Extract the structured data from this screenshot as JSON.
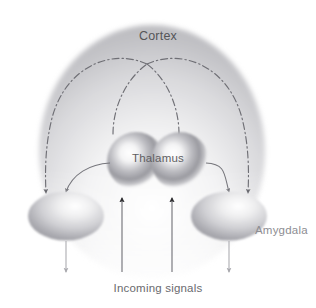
{
  "figure": {
    "title_region": "brain-fear-pathway-diagram",
    "background_color": "#ffffff"
  },
  "labels": {
    "cortex": "Cortex",
    "thalamus": "Thalamus",
    "amygdala": "Amygdala",
    "incoming_signals": "Incoming signals"
  },
  "colors": {
    "cortex_fill_dark": "#b9b9bc",
    "cortex_fill_light": "#ffffff",
    "sphere_core": "#ffffff",
    "sphere_ring": "#8e8e93",
    "ellipse_highlight": "#ffffff",
    "ellipse_shadow": "#9a9a9f",
    "dashdot_stroke": "#6f6f75",
    "curve_stroke": "#76767c",
    "incoming_arrow": "#303033",
    "output_arrow": "#a8a8ad",
    "cortex_text": "#555558",
    "thalamus_text": "#5e5e62",
    "amygdala_text": "#8d8d92",
    "incoming_text": "#6a6a6e"
  },
  "structures": {
    "cortex": {
      "name": "Cortex",
      "shape": "dome",
      "center_x": 152,
      "center_y": 150,
      "radius_x": 113,
      "radius_y": 125
    },
    "thalamus_left_sphere": {
      "name": "Thalamus left nucleus",
      "cx": 136,
      "cy": 161,
      "r": 29
    },
    "thalamus_right_sphere": {
      "name": "Thalamus right nucleus",
      "cx": 180,
      "cy": 161,
      "r": 29
    },
    "amygdala_left": {
      "name": "Amygdala left",
      "cx": 66,
      "cy": 216,
      "rx": 37,
      "ry": 24
    },
    "amygdala_right": {
      "name": "Amygdala right",
      "cx": 229,
      "cy": 216,
      "rx": 37,
      "ry": 24
    }
  },
  "pathways": [
    {
      "id": "thalamus-to-cortex-left",
      "style": "dash-dot",
      "from": "thalamus",
      "to": "cortex",
      "direction": "up"
    },
    {
      "id": "thalamus-to-cortex-right",
      "style": "dash-dot",
      "from": "thalamus",
      "to": "cortex",
      "direction": "up"
    },
    {
      "id": "cortex-to-amygdala-left",
      "style": "dash-dot",
      "from": "cortex",
      "to": "amygdala-left",
      "direction": "down",
      "arrowhead": true
    },
    {
      "id": "cortex-to-amygdala-right",
      "style": "dash-dot",
      "from": "cortex",
      "to": "amygdala-right",
      "direction": "down",
      "arrowhead": true
    },
    {
      "id": "thalamus-to-amygdala-left",
      "style": "solid-curve",
      "from": "thalamus",
      "to": "amygdala-left",
      "direction": "down",
      "arrowhead": true
    },
    {
      "id": "thalamus-to-amygdala-right",
      "style": "solid-curve",
      "from": "thalamus",
      "to": "amygdala-right",
      "direction": "down",
      "arrowhead": true
    },
    {
      "id": "incoming-signal-left",
      "style": "solid-straight",
      "from": "incoming signals",
      "to": "thalamus",
      "direction": "up",
      "arrowhead": true
    },
    {
      "id": "incoming-signal-right",
      "style": "solid-straight",
      "from": "incoming signals",
      "to": "thalamus",
      "direction": "up",
      "arrowhead": true
    },
    {
      "id": "amygdala-left-output",
      "style": "solid-straight",
      "from": "amygdala-left",
      "to": "output",
      "direction": "down",
      "arrowhead": true
    },
    {
      "id": "amygdala-right-output",
      "style": "solid-straight",
      "from": "amygdala-right",
      "to": "output",
      "direction": "down",
      "arrowhead": true
    }
  ]
}
